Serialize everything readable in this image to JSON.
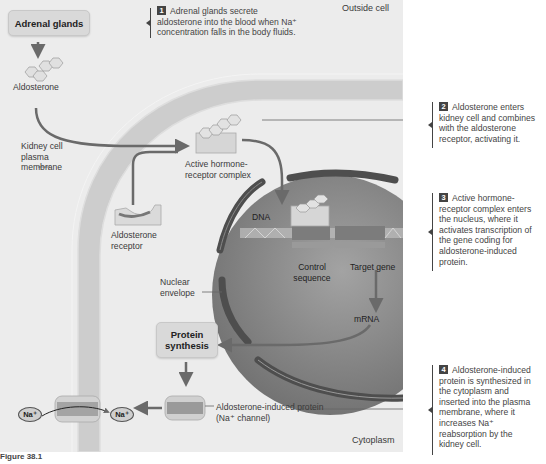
{
  "regions": {
    "outside": "Outside cell",
    "cytoplasm": "Cytoplasm"
  },
  "boxes": {
    "adrenal": "Adrenal glands",
    "protein_synthesis_1": "Protein",
    "protein_synthesis_2": "synthesis"
  },
  "labels": {
    "aldosterone": "Aldosterone",
    "membrane_1": "Kidney cell",
    "membrane_2": "plasma",
    "membrane_3": "membrane",
    "complex_1": "Active hormone-",
    "complex_2": "receptor complex",
    "receptor_1": "Aldosterone",
    "receptor_2": "receptor",
    "dna": "DNA",
    "control_1": "Control",
    "control_2": "sequence",
    "target": "Target gene",
    "envelope_1": "Nuclear",
    "envelope_2": "envelope",
    "mrna": "mRNA",
    "induced_1": "Aldosterone-induced protein",
    "induced_2": "(Na⁺ channel)",
    "na_left": "Na⁺",
    "na_right": "Na⁺"
  },
  "steps": [
    {
      "num": "1",
      "lines": [
        "Adrenal glands secrete",
        "aldosterone into the blood when Na⁺",
        "concentration falls in the body fluids."
      ]
    },
    {
      "num": "2",
      "lines": [
        "Aldosterone enters",
        "kidney cell and combines",
        "with the aldosterone",
        "receptor, activating it."
      ]
    },
    {
      "num": "3",
      "lines": [
        "Active hormone-",
        "receptor complex enters",
        "the nucleus, where it",
        "activates transcription of",
        "the gene coding for",
        "aldosterone-induced",
        "protein."
      ]
    },
    {
      "num": "4",
      "lines": [
        "Aldosterone-induced",
        "protein is synthesized in",
        "the cytoplasm and",
        "inserted into the plasma",
        "membrane, where it",
        "increases Na⁺",
        "reabsorption by the",
        "kidney cell."
      ]
    }
  ],
  "caption": "Figure 38.1",
  "colors": {
    "panel_bg": "#ececec",
    "membrane": "#cfcfcf",
    "nucleus": "#8a8a8a",
    "arrow": "#6a6a6a",
    "text": "#3a3a3a"
  }
}
